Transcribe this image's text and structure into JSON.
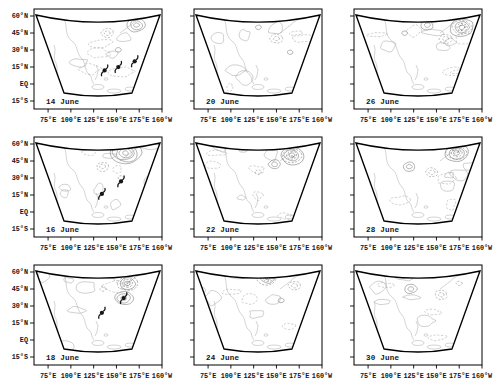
{
  "figure": {
    "kind": "multi-panel contour map figure",
    "background": "#ffffff",
    "frame_color": "#000000",
    "contour_color": "#9c9c9c",
    "coast_color": "#bdbdbd",
    "symbol_color": "#161616"
  },
  "axes": {
    "lat_labels": [
      "60°N",
      "45°N",
      "30°N",
      "15°N",
      "EQ",
      "15°S"
    ],
    "lon_labels": [
      "75°E",
      "100°E",
      "125°E",
      "150°E",
      "175°E",
      "160°W"
    ]
  },
  "chart_data": {
    "type": "contour-map-grid",
    "rows": 3,
    "cols": 3,
    "projection": "conic (fan) sector, 75°E-160°W, 15°S-60°N",
    "y_axis": {
      "ticks": [
        "60°N",
        "45°N",
        "30°N",
        "15°N",
        "EQ",
        "15°S"
      ],
      "lat_values": [
        60,
        45,
        30,
        15,
        0,
        -15
      ]
    },
    "x_axis": {
      "ticks": [
        "75°E",
        "100°E",
        "125°E",
        "150°E",
        "175°E",
        "160°W"
      ],
      "lon_values_deg_east": [
        75,
        100,
        125,
        150,
        175,
        200
      ]
    },
    "contour_style": {
      "positive": "solid",
      "negative": "dashed"
    },
    "panels": [
      {
        "date": "14 June",
        "typhoons": [
          {
            "lat": 12,
            "lon": 137
          },
          {
            "lat": 15,
            "lon": 152
          },
          {
            "lat": 20,
            "lon": 170
          }
        ],
        "clusters": [
          {
            "lat": 52,
            "lon": 172,
            "rings": 3,
            "style": "solid"
          },
          {
            "lat": 45,
            "lon": 140,
            "rings": 2,
            "style": "dashed"
          },
          {
            "lat": 30,
            "lon": 152,
            "rings": 1,
            "style": "solid"
          }
        ]
      },
      {
        "date": "20 June",
        "typhoons": [],
        "clusters": [
          {
            "lat": 40,
            "lon": 150,
            "rings": 2,
            "style": "dashed"
          },
          {
            "lat": 50,
            "lon": 130,
            "rings": 1,
            "style": "solid"
          },
          {
            "lat": 28,
            "lon": 165,
            "rings": 1,
            "style": "solid"
          }
        ]
      },
      {
        "date": "26 June",
        "typhoons": [],
        "clusters": [
          {
            "lat": 50,
            "lon": 178,
            "rings": 5,
            "style": "dense"
          },
          {
            "lat": 52,
            "lon": 140,
            "rings": 2,
            "style": "solid"
          },
          {
            "lat": 40,
            "lon": 160,
            "rings": 2,
            "style": "dashed"
          },
          {
            "lat": 45,
            "lon": 115,
            "rings": 1,
            "style": "solid"
          }
        ]
      },
      {
        "date": "16 June",
        "typhoons": [
          {
            "lat": 16,
            "lon": 134
          },
          {
            "lat": 27,
            "lon": 155
          }
        ],
        "clusters": [
          {
            "lat": 52,
            "lon": 160,
            "rings": 5,
            "style": "solid"
          },
          {
            "lat": 40,
            "lon": 135,
            "rings": 2,
            "style": "dashed"
          },
          {
            "lat": 30,
            "lon": 155,
            "rings": 1,
            "style": "dashed"
          }
        ]
      },
      {
        "date": "22 June",
        "typhoons": [],
        "clusters": [
          {
            "lat": 50,
            "lon": 167,
            "rings": 5,
            "style": "dense"
          },
          {
            "lat": 42,
            "lon": 148,
            "rings": 2,
            "style": "solid"
          },
          {
            "lat": 35,
            "lon": 130,
            "rings": 1,
            "style": "dashed"
          }
        ]
      },
      {
        "date": "28 June",
        "typhoons": [],
        "clusters": [
          {
            "lat": 52,
            "lon": 172,
            "rings": 5,
            "style": "dense"
          },
          {
            "lat": 40,
            "lon": 120,
            "rings": 2,
            "style": "solid"
          },
          {
            "lat": 35,
            "lon": 145,
            "rings": 2,
            "style": "dashed"
          }
        ]
      },
      {
        "date": "18 June",
        "typhoons": [
          {
            "lat": 24,
            "lon": 134
          },
          {
            "lat": 37,
            "lon": 158
          }
        ],
        "clusters": [
          {
            "lat": 50,
            "lon": 162,
            "rings": 4,
            "style": "dense"
          },
          {
            "lat": 37,
            "lon": 158,
            "rings": 3,
            "style": "solid"
          },
          {
            "lat": 45,
            "lon": 135,
            "rings": 1,
            "style": "dashed"
          }
        ]
      },
      {
        "date": "24 June",
        "typhoons": [],
        "clusters": [
          {
            "lat": 55,
            "lon": 140,
            "rings": 4,
            "style": "dense"
          },
          {
            "lat": 48,
            "lon": 170,
            "rings": 2,
            "style": "dashed"
          },
          {
            "lat": 35,
            "lon": 155,
            "rings": 1,
            "style": "solid"
          }
        ]
      },
      {
        "date": "30 June",
        "typhoons": [],
        "clusters": [
          {
            "lat": 45,
            "lon": 122,
            "rings": 2,
            "style": "solid"
          },
          {
            "lat": 40,
            "lon": 155,
            "rings": 2,
            "style": "dashed"
          },
          {
            "lat": 50,
            "lon": 175,
            "rings": 1,
            "style": "dashed"
          }
        ]
      }
    ]
  }
}
